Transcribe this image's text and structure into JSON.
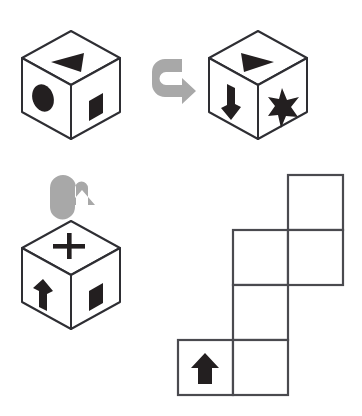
{
  "diagram": {
    "background_color": "#ffffff",
    "ink_color": "#2e2e33",
    "symbol_color": "#231f20",
    "arrow_color": "#a8a8a8",
    "net_line_color": "#4a4a4f"
  },
  "cubes": [
    {
      "id": "cube-1",
      "position": "top-left",
      "faces": {
        "top": {
          "symbol": "triangle-left-icon",
          "label": "left-pointing triangle"
        },
        "left": {
          "symbol": "ellipse-icon",
          "label": "filled ellipse"
        },
        "right": {
          "symbol": "square-icon",
          "label": "filled square"
        }
      }
    },
    {
      "id": "cube-2",
      "position": "top-right",
      "faces": {
        "top": {
          "symbol": "triangle-right-icon",
          "label": "right-pointing triangle"
        },
        "left": {
          "symbol": "arrow-down-icon",
          "label": "down arrow"
        },
        "right": {
          "symbol": "star-icon",
          "label": "five-pointed star"
        }
      }
    },
    {
      "id": "cube-3",
      "position": "bottom-left",
      "faces": {
        "top": {
          "symbol": "plus-icon",
          "label": "plus sign"
        },
        "left": {
          "symbol": "arrow-up-icon",
          "label": "up arrow"
        },
        "right": {
          "symbol": "square-icon",
          "label": "filled square"
        }
      }
    }
  ],
  "rotation_arrows": [
    {
      "id": "rotate-arrow-right",
      "symbol": "u-turn-arrow-right-icon",
      "label": "rotation arrow pointing right",
      "from_cube": "cube-1",
      "to_cube": "cube-2"
    },
    {
      "id": "rotate-arrow-up",
      "symbol": "u-turn-arrow-up-icon",
      "label": "rotation arrow pointing up",
      "from_cube": "cube-3",
      "to_cube": "cube-1"
    }
  ],
  "net": {
    "id": "cube-net",
    "label": "unfolded cube net",
    "columns": 3,
    "rows": 4,
    "cell_size": 55,
    "cells": [
      {
        "col": 2,
        "row": 0,
        "symbol": null
      },
      {
        "col": 1,
        "row": 1,
        "symbol": null
      },
      {
        "col": 2,
        "row": 1,
        "symbol": null
      },
      {
        "col": 1,
        "row": 2,
        "symbol": null
      },
      {
        "col": 0,
        "row": 3,
        "symbol": "arrow-up-icon"
      },
      {
        "col": 1,
        "row": 3,
        "symbol": null
      }
    ]
  }
}
